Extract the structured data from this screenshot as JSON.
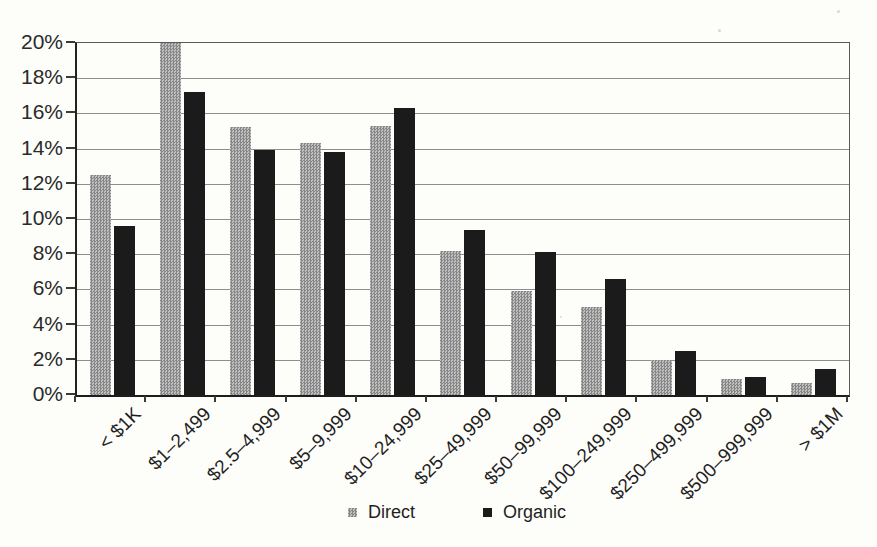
{
  "chart_data": {
    "type": "bar",
    "title": "",
    "categories": [
      "< $1K",
      "$1–2,499",
      "$2.5–4,999",
      "$5–9,999",
      "$10–24,999",
      "$25–49,999",
      "$50–99,999",
      "$100–249,999",
      "$250–499,999",
      "$500–999,999",
      "> $1M"
    ],
    "series": [
      {
        "name": "Direct",
        "color": "#a6a6a6",
        "values": [
          12.5,
          20.0,
          15.2,
          14.3,
          15.3,
          8.2,
          5.9,
          5.0,
          2.0,
          0.9,
          0.7
        ]
      },
      {
        "name": "Organic",
        "color": "#1b1b1b",
        "values": [
          9.6,
          17.2,
          13.9,
          13.8,
          16.3,
          9.4,
          8.1,
          6.6,
          2.5,
          1.0,
          1.5
        ]
      }
    ],
    "xlabel": "",
    "ylabel": "",
    "ylim": [
      0,
      20
    ],
    "ytick_step": 2,
    "yticks": [
      "0%",
      "2%",
      "4%",
      "6%",
      "8%",
      "10%",
      "12%",
      "14%",
      "16%",
      "18%",
      "20%"
    ],
    "grid": true,
    "legend_position": "bottom"
  }
}
